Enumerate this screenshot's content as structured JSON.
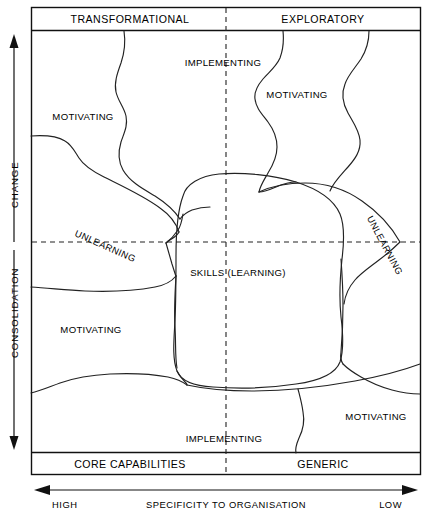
{
  "figure": {
    "quadrant_headers": {
      "top_left": "TRANSFORMATIONAL",
      "top_right": "EXPLORATORY"
    },
    "quadrant_footers": {
      "bottom_left": "CORE CAPABILITIES",
      "bottom_right": "GENERIC"
    },
    "vertical_axis": {
      "upper_label": "CHANGE",
      "lower_label": "CONSOLIDATION"
    },
    "horizontal_axis": {
      "label": "SPECIFICITY TO ORGANISATION",
      "left_end": "HIGH",
      "right_end": "LOW"
    },
    "center_cell": "SKILLS (LEARNING)",
    "cells": [
      {
        "id": "cell-motivating-top-left",
        "label": "MOTIVATING"
      },
      {
        "id": "cell-implementing-top-center",
        "label": "IMPLEMENTING"
      },
      {
        "id": "cell-motivating-top-right",
        "label": "MOTIVATING"
      },
      {
        "id": "cell-motivating-bottom-left",
        "label": "MOTIVATING"
      },
      {
        "id": "cell-implementing-bottom-center",
        "label": "IMPLEMENTING"
      },
      {
        "id": "cell-motivating-bottom-right",
        "label": "MOTIVATING"
      }
    ],
    "unlearning": {
      "left": "UNLEARNING",
      "right": "UNLEARNING"
    },
    "colors": {
      "stroke": "#222222",
      "frame": "#111111",
      "background": "#ffffff"
    }
  }
}
